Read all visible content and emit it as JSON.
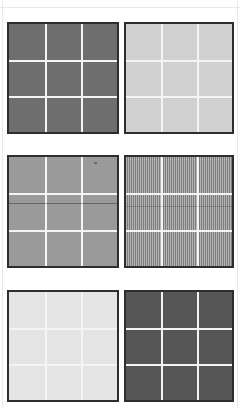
{
  "page": {
    "background_color": "#ffffff",
    "width": 240,
    "height": 409,
    "rule_color": "#e9e9e9",
    "columns": 2,
    "rows": 3
  },
  "panel_defaults": {
    "border_color": "#2e2e2e",
    "border_width_px": 2,
    "gridline_color": "#f4f4f4",
    "gridline_width_px": 2,
    "grid_divisions": 3
  },
  "panels": [
    {
      "id": "panel-1",
      "position": "top-left",
      "row": 1,
      "column": 1,
      "tone": "dark-medium-gray",
      "fill_color": "#6e6e6e",
      "texture": "flat",
      "x": 7,
      "y": 22,
      "width": 112,
      "height": 112,
      "artifacts": []
    },
    {
      "id": "panel-2",
      "position": "top-right",
      "row": 1,
      "column": 2,
      "tone": "light-gray",
      "fill_color": "#d2d2d2",
      "texture": "flat",
      "x": 124,
      "y": 22,
      "width": 110,
      "height": 112,
      "artifacts": []
    },
    {
      "id": "panel-3",
      "position": "middle-left",
      "row": 2,
      "column": 1,
      "tone": "mid-gray",
      "fill_color": "#9a9a9a",
      "texture": "flat",
      "x": 7,
      "y": 155,
      "width": 112,
      "height": 113,
      "artifacts": [
        "dark-horizontal-band",
        "speck"
      ]
    },
    {
      "id": "panel-4",
      "position": "middle-right",
      "row": 2,
      "column": 2,
      "tone": "mid-gray-striped",
      "fill_color": "#9c9c9c",
      "texture": "fine-vertical-stripes",
      "x": 124,
      "y": 155,
      "width": 110,
      "height": 113,
      "artifacts": [
        "faint-horizontal-band"
      ]
    },
    {
      "id": "panel-5",
      "position": "bottom-left",
      "row": 3,
      "column": 1,
      "tone": "very-light-gray",
      "fill_color": "#e6e6e6",
      "texture": "flat",
      "x": 7,
      "y": 290,
      "width": 112,
      "height": 112,
      "artifacts": []
    },
    {
      "id": "panel-6",
      "position": "bottom-right",
      "row": 3,
      "column": 2,
      "tone": "darkest-gray",
      "fill_color": "#555555",
      "texture": "flat",
      "x": 124,
      "y": 290,
      "width": 110,
      "height": 112,
      "artifacts": []
    }
  ]
}
